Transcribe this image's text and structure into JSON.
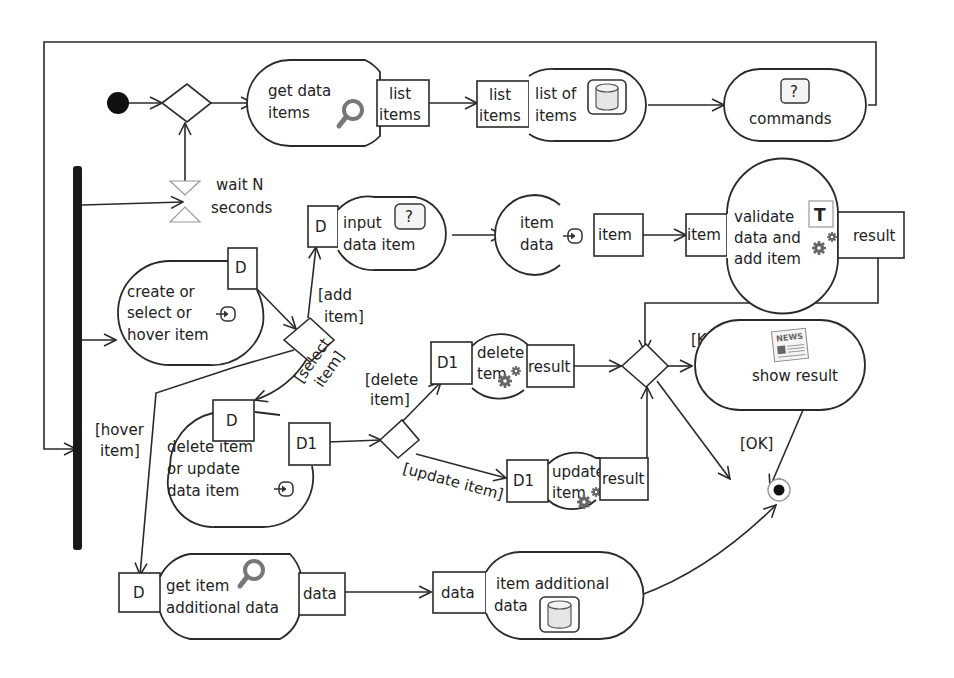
{
  "diagram": {
    "type": "UML activity diagram",
    "colors": {
      "stroke": "#2a2a2a",
      "fork_bar": "#1a1a1a",
      "icon_gray": "#777777",
      "db_fill": "#e6e6e6"
    },
    "start_node": {
      "label": ""
    },
    "wait": {
      "line1": "wait N",
      "line2": "seconds"
    },
    "actions": {
      "get_data_items": {
        "line1": "get data",
        "line2": "items",
        "icon": "search-icon",
        "out_pin": {
          "line1": "list",
          "line2": "items"
        }
      },
      "list_of_items": {
        "line1": "list of",
        "line2": "items",
        "icon": "database-icon",
        "in_pin": {
          "line1": "list",
          "line2": "items"
        }
      },
      "commands": {
        "line1": "commands",
        "icon": "question-icon",
        "icon_text": "?"
      },
      "create_select_hover": {
        "line1": "create or",
        "line2": "select or",
        "line3": "hover item",
        "icon": "input-icon",
        "out_pin": "D"
      },
      "input_data_item": {
        "line1": "input",
        "line2": "data item",
        "icon": "question-icon",
        "icon_text": "?",
        "in_pin": "D"
      },
      "item_data": {
        "line1": "item",
        "line2": "data",
        "icon": "input-icon",
        "out_pin": "item"
      },
      "validate_add": {
        "line1": "validate",
        "line2": "data and",
        "line3": "add item",
        "icon": "gears-icon",
        "badge": "T",
        "in_pin": "item",
        "out_pin": "result"
      },
      "delete_or_update": {
        "line1": "delete item",
        "line2": "or update",
        "line3": "data item",
        "icon": "input-icon",
        "in_pin": "D",
        "out_pin": "D1"
      },
      "delete_item": {
        "line1": "delete",
        "line2": "tem",
        "icon": "gears-icon",
        "in_pin": "D1",
        "out_pin": "result"
      },
      "update_item": {
        "line1": "update",
        "line2": "item",
        "icon": "gears-icon",
        "in_pin": "D1",
        "out_pin": "result"
      },
      "show_result": {
        "line1": "show result",
        "icon": "news-icon",
        "icon_text": "NEWS"
      },
      "get_item_additional": {
        "line1": "get item",
        "line2": "additional data",
        "icon": "search-icon",
        "in_pin": "D",
        "out_pin": "data"
      },
      "item_additional_data": {
        "line1": "item additional",
        "line2": "data",
        "icon": "database-icon",
        "in_pin": "data"
      }
    },
    "guards": {
      "add_item": {
        "line1": "[add",
        "line2": "item]"
      },
      "select_item": {
        "line1": "[select",
        "line2": "item]"
      },
      "hover_item": {
        "line1": "[hover",
        "line2": "item]"
      },
      "delete_item": {
        "line1": "[delete",
        "line2": "item]"
      },
      "update_item": "[update item]",
      "ko": "[KO]",
      "ok": "[OK]"
    }
  }
}
